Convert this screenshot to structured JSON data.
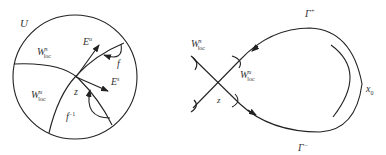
{
  "left_diagram": {
    "region_label": "U",
    "stable_manifold_label": "W",
    "stable_manifold_sup": "s",
    "stable_manifold_sub": "loc",
    "unstable_manifold_label": "W",
    "unstable_manifold_sup": "u",
    "unstable_manifold_sub": "loc",
    "unstable_eigen_label": "E",
    "unstable_eigen_sup": "u",
    "stable_eigen_label": "E",
    "stable_eigen_sup": "s",
    "map_label": "f",
    "inverse_map_label": "f",
    "inverse_map_sup": "−1",
    "fixed_point_label": "z"
  },
  "right_diagram": {
    "unstable_branch_label": "Γ",
    "unstable_branch_sup": "+",
    "stable_branch_label": "Γ",
    "stable_branch_sup": "−",
    "stable_manifold_label": "W",
    "stable_manifold_sup": "s",
    "stable_manifold_sub": "loc",
    "unstable_manifold_label": "W",
    "unstable_manifold_sup": "u",
    "unstable_manifold_sub": "loc",
    "fixed_point_label": "z",
    "tangency_point_label": "x",
    "tangency_point_sub": "0"
  },
  "colors": {
    "stroke": "#222222",
    "text": "#333333"
  }
}
